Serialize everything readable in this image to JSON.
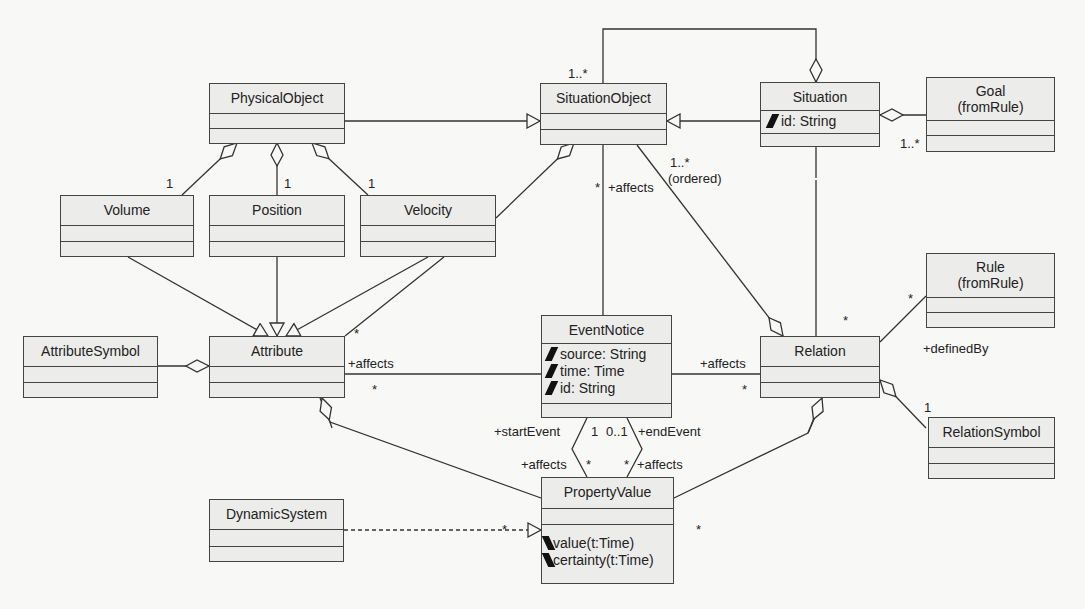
{
  "diagram": {
    "type": "UML class diagram",
    "classes": {
      "physical_object": {
        "name": "PhysicalObject",
        "attributes": [],
        "operations": []
      },
      "situation_object": {
        "name": "SituationObject",
        "attributes": [],
        "operations": []
      },
      "situation": {
        "name": "Situation",
        "attributes": [
          "id: String"
        ],
        "operations": []
      },
      "goal": {
        "name": "Goal",
        "stereotype": "(fromRule)",
        "attributes": [],
        "operations": []
      },
      "volume": {
        "name": "Volume",
        "attributes": [],
        "operations": []
      },
      "position": {
        "name": "Position",
        "attributes": [],
        "operations": []
      },
      "velocity": {
        "name": "Velocity",
        "attributes": [],
        "operations": []
      },
      "attribute_symbol": {
        "name": "AttributeSymbol",
        "attributes": [],
        "operations": []
      },
      "attribute": {
        "name": "Attribute",
        "attributes": [],
        "operations": []
      },
      "event_notice": {
        "name": "EventNotice",
        "attributes": [
          "source: String",
          "time: Time",
          "id: String"
        ],
        "operations": []
      },
      "relation": {
        "name": "Relation",
        "attributes": [],
        "operations": []
      },
      "rule": {
        "name": "Rule",
        "stereotype": "(fromRule)",
        "attributes": [],
        "operations": []
      },
      "relation_symbol": {
        "name": "RelationSymbol",
        "attributes": [],
        "operations": []
      },
      "dynamic_system": {
        "name": "DynamicSystem",
        "attributes": [],
        "operations": []
      },
      "property_value": {
        "name": "PropertyValue",
        "attributes": [],
        "operations": [
          "value(t:Time)",
          "certainty(t:Time)"
        ]
      }
    },
    "labels": {
      "so_situation_mult": "1..*",
      "goal_mult": "1..*",
      "vol_mult": "1",
      "pos_mult": "1",
      "vel_mult": "1",
      "so_event_mult": "*",
      "so_event_role": "+affects",
      "so_relation_mult": "1..*",
      "so_relation_ordered": "(ordered)",
      "attr_velocity_mult": "*",
      "attr_event_role": "+affects",
      "attr_event_mult": "*",
      "event_relation_role": "+affects",
      "event_relation_mult": "*",
      "relation_situation_mult": "*",
      "rule_mult": "*",
      "defined_by_role": "+definedBy",
      "relation_symbol_mult": "1",
      "start_event_role": "+startEvent",
      "start_event_mult": "1",
      "end_event_mult": "0..1",
      "end_event_role": "+endEvent",
      "pv_affects_left_role": "+affects",
      "pv_affects_left_mult": "*",
      "pv_affects_right_mult": "*",
      "pv_affects_right_role": "+affects",
      "pv_attr_mult": "*",
      "pv_relation_mult": "*"
    }
  }
}
